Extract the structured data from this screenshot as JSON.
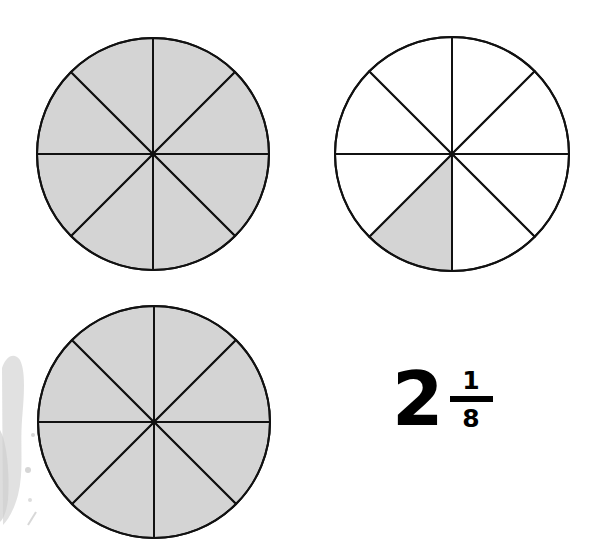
{
  "figure": {
    "colors": {
      "shaded": "#d4d4d4",
      "unshaded": "#ffffff",
      "outline": "#111111",
      "smudge": "#d9d9d9"
    },
    "circles": [
      {
        "id": "circle-1",
        "cx": 153,
        "cy": 154,
        "r": 116,
        "parts": 8,
        "shaded_parts": 8,
        "shaded_slices": [
          0,
          1,
          2,
          3,
          4,
          5,
          6,
          7
        ]
      },
      {
        "id": "circle-2",
        "cx": 452,
        "cy": 154,
        "r": 117,
        "parts": 8,
        "shaded_parts": 1,
        "shaded_slices": [
          4
        ]
      },
      {
        "id": "circle-3",
        "cx": 154,
        "cy": 422,
        "r": 116,
        "parts": 8,
        "shaded_parts": 8,
        "shaded_slices": [
          0,
          1,
          2,
          3,
          4,
          5,
          6,
          7
        ]
      }
    ],
    "label": {
      "whole": "2",
      "numerator": "1",
      "denominator": "8",
      "text": "2 1/8"
    }
  }
}
